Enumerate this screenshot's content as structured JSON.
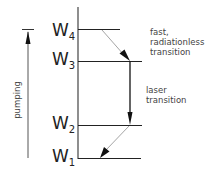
{
  "levels": [
    {
      "id": "W4",
      "base": "W",
      "sub": "4"
    },
    {
      "id": "W3",
      "base": "W",
      "sub": "3"
    },
    {
      "id": "W2",
      "base": "W",
      "sub": "2"
    },
    {
      "id": "W1",
      "base": "W",
      "sub": "1"
    }
  ],
  "annotations": {
    "fast_line1": "fast,",
    "fast_line2": "radiationless",
    "fast_line3": "transition",
    "laser_line1": "laser",
    "laser_line2": "transition",
    "pumping": "pumping"
  },
  "colors": {
    "line": "#1a1a1a",
    "faint_arrow": "#9a9a9a"
  }
}
